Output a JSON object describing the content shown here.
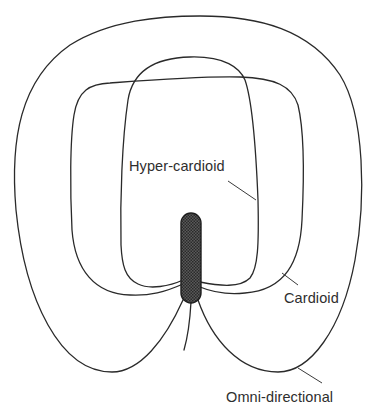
{
  "diagram": {
    "labels": {
      "hyper_cardioid": "Hyper-cardioid",
      "cardioid": "Cardioid",
      "omni_directional": "Omni-directional"
    },
    "patterns": [
      {
        "name": "Omni-directional",
        "role": "outer curve"
      },
      {
        "name": "Cardioid",
        "role": "middle curve"
      },
      {
        "name": "Hyper-cardioid",
        "role": "inner curve"
      }
    ],
    "microphone": {
      "fill": "#4a4a4a",
      "texture": "crosshatch"
    },
    "colors": {
      "stroke": "#2a2a2a",
      "text": "#2e2e2e",
      "background": "#ffffff"
    }
  }
}
